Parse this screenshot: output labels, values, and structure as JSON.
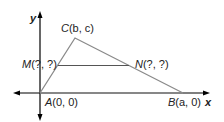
{
  "diagram": {
    "axes": {
      "x_label": "x",
      "y_label": "y"
    },
    "points": {
      "A": {
        "name": "A",
        "coords": "(0, 0)"
      },
      "B": {
        "name": "B",
        "coords": "(a, 0)"
      },
      "C": {
        "name": "C",
        "coords": "(b, c)"
      },
      "M": {
        "name": "M",
        "coords": "(?, ?)"
      },
      "N": {
        "name": "N",
        "coords": "(?, ?)"
      }
    },
    "colors": {
      "axis": "#000000",
      "triangle": "#8a8a8a",
      "text": "#222222"
    }
  }
}
